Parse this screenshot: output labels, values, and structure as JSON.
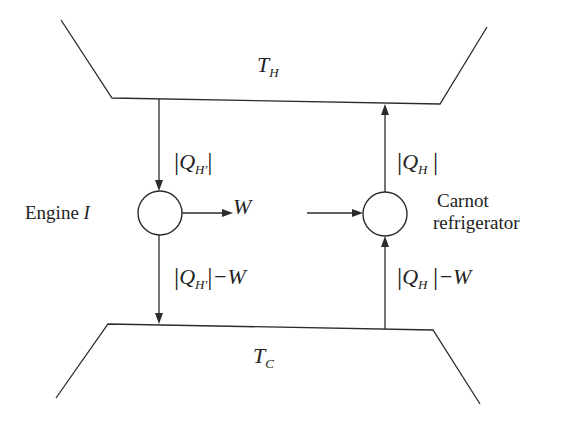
{
  "diagram": {
    "hot_reservoir": {
      "symbol": "T",
      "subscript": "H"
    },
    "cold_reservoir": {
      "symbol": "T",
      "subscript": "C"
    },
    "engine": {
      "label": "Engine",
      "label_var": "I",
      "heat_in": {
        "symbol": "Q",
        "subscript": "H′"
      },
      "work_out": "W",
      "heat_out": {
        "symbol": "Q",
        "subscript": "H′",
        "suffix": "−W"
      }
    },
    "refrigerator": {
      "label_line1": "Carnot",
      "label_line2": "refrigerator",
      "heat_out": {
        "symbol": "Q",
        "subscript": "H"
      },
      "heat_in": {
        "symbol": "Q",
        "subscript": "H",
        "suffix": "−W"
      }
    },
    "abs_bar": "|",
    "colors": {
      "stroke": "#2b2b2b",
      "text": "#222222",
      "background": "#ffffff"
    }
  }
}
